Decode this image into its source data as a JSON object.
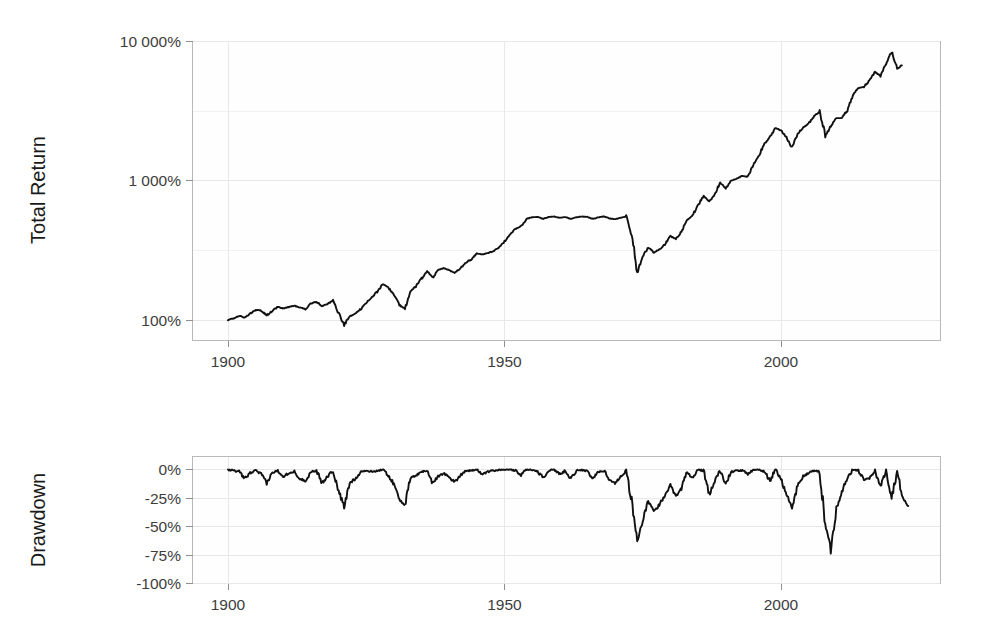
{
  "figure": {
    "background_color": "#ffffff",
    "line_color": "#111111",
    "grid_color": "#e8e8e8",
    "frame_color": "#b9b9b9"
  },
  "panels": {
    "top": {
      "ylabel": "Total Return",
      "y_ticks": [
        "10 000%",
        "1 000%",
        "100%"
      ],
      "x_ticks": [
        "1900",
        "1950",
        "2000"
      ]
    },
    "bottom": {
      "ylabel": "Drawdown",
      "y_ticks": [
        "0%",
        "-25%",
        "-50%",
        "-75%",
        "-100%"
      ],
      "x_ticks": [
        "1900",
        "1950",
        "2000"
      ]
    }
  },
  "chart_data": [
    {
      "type": "line",
      "title": "",
      "xlabel": "",
      "ylabel": "Total Return",
      "yscale": "log",
      "ylim": [
        70,
        13000
      ],
      "xlim": [
        1899,
        1924.5
      ],
      "grid": true,
      "legend": "none",
      "ytick_values": [
        100,
        1000,
        10000
      ],
      "ytick_labels": [
        "100%",
        "1 000%",
        "10 000%"
      ],
      "xtick_values": [
        1900,
        1950,
        2000
      ],
      "xtick_labels": [
        "1900",
        "1950",
        "2000"
      ],
      "series": [
        {
          "name": "Total Return",
          "x": [
            1900,
            1901,
            1902,
            1903,
            1904,
            1905,
            1906,
            1907,
            1908,
            1909,
            1910,
            1911,
            1912,
            1913,
            1914,
            1915,
            1916,
            1917,
            1918,
            1919,
            1920,
            1921,
            1922,
            1923,
            1924,
            1925,
            1926,
            1927,
            1928,
            1929,
            1930,
            1931,
            1932,
            1933,
            1934,
            1935,
            1936,
            1937,
            1938,
            1939,
            1940,
            1941,
            1942,
            1943,
            1944,
            1945,
            1946,
            1947,
            1948,
            1949,
            1950,
            1951,
            1952,
            1953,
            1954,
            1955,
            1956,
            1957,
            1958,
            1959,
            1960,
            1961,
            1962,
            1963,
            1964,
            1965,
            1966,
            1967,
            1968,
            1969,
            1970,
            1971,
            1972,
            1973,
            1974,
            1975,
            1976,
            1977,
            1978,
            1979,
            1980,
            1981,
            1982,
            1983,
            1984,
            1985,
            1986,
            1987,
            1988,
            1989,
            1990,
            1991,
            1992,
            1993,
            1994,
            1995,
            1996,
            1997,
            1998,
            1999,
            2000,
            2001,
            2002,
            2003,
            2004,
            2005,
            2006,
            2007,
            2008,
            2009,
            2010,
            2011,
            2012,
            2013,
            2014,
            2015,
            2016,
            2017,
            2018,
            2019,
            2020,
            2021,
            2022,
            2023
          ],
          "y": [
            100,
            103,
            107,
            104,
            111,
            118,
            117,
            108,
            116,
            124,
            121,
            124,
            127,
            123,
            120,
            131,
            135,
            126,
            130,
            138,
            112,
            92,
            106,
            110,
            120,
            133,
            145,
            160,
            180,
            172,
            150,
            128,
            120,
            160,
            175,
            198,
            225,
            200,
            228,
            235,
            228,
            218,
            232,
            258,
            272,
            300,
            295,
            302,
            312,
            330,
            365,
            410,
            450,
            470,
            530,
            545,
            548,
            530,
            548,
            552,
            540,
            548,
            530,
            545,
            552,
            548,
            530,
            545,
            552,
            535,
            528,
            540,
            552,
            400,
            215,
            285,
            330,
            305,
            320,
            350,
            400,
            380,
            430,
            520,
            560,
            660,
            780,
            700,
            790,
            960,
            880,
            1000,
            1030,
            1080,
            1060,
            1290,
            1500,
            1830,
            2050,
            2380,
            2280,
            2050,
            1700,
            2150,
            2400,
            2550,
            2900,
            3100,
            2050,
            2450,
            2800,
            2800,
            3200,
            4100,
            4600,
            4700,
            5200,
            6000,
            5600,
            6800,
            8400,
            6300,
            6800
          ],
          "notes": "S&P/US equities cumulative total return, indexed to 100% at 1900, log scale"
        }
      ]
    },
    {
      "type": "line",
      "title": "",
      "xlabel": "",
      "ylabel": "Drawdown",
      "yscale": "linear",
      "ylim": [
        -100,
        3
      ],
      "xlim": [
        1899,
        1924.5
      ],
      "grid": true,
      "legend": "none",
      "ytick_values": [
        0,
        -25,
        -50,
        -75,
        -100
      ],
      "ytick_labels": [
        "0%",
        "-25%",
        "-50%",
        "-75%",
        "-100%"
      ],
      "xtick_values": [
        1900,
        1950,
        2000
      ],
      "xtick_labels": [
        "1900",
        "1950",
        "2000"
      ],
      "series": [
        {
          "name": "Drawdown",
          "x": [
            1900,
            1901,
            1902,
            1903,
            1904,
            1905,
            1906,
            1907,
            1908,
            1909,
            1910,
            1911,
            1912,
            1913,
            1914,
            1915,
            1916,
            1917,
            1918,
            1919,
            1920,
            1921,
            1922,
            1923,
            1924,
            1925,
            1926,
            1927,
            1928,
            1929,
            1930,
            1931,
            1932,
            1933,
            1934,
            1935,
            1936,
            1937,
            1938,
            1939,
            1940,
            1941,
            1942,
            1943,
            1944,
            1945,
            1946,
            1947,
            1948,
            1949,
            1950,
            1951,
            1952,
            1953,
            1954,
            1955,
            1956,
            1957,
            1958,
            1959,
            1960,
            1961,
            1962,
            1963,
            1964,
            1965,
            1966,
            1967,
            1968,
            1969,
            1970,
            1971,
            1972,
            1973,
            1974,
            1975,
            1976,
            1977,
            1978,
            1979,
            1980,
            1981,
            1982,
            1983,
            1984,
            1985,
            1986,
            1987,
            1988,
            1989,
            1990,
            1991,
            1992,
            1993,
            1994,
            1995,
            1996,
            1997,
            1998,
            1999,
            2000,
            2001,
            2002,
            2003,
            2004,
            2005,
            2006,
            2007,
            2008,
            2009,
            2010,
            2011,
            2012,
            2013,
            2014,
            2015,
            2016,
            2017,
            2018,
            2019,
            2020,
            2021,
            2022,
            2023
          ],
          "y": [
            0,
            -1,
            -2,
            -8,
            -3,
            -1,
            -4,
            -12,
            -3,
            -1,
            -6,
            -3,
            -2,
            -8,
            -10,
            -2,
            -1,
            -12,
            -6,
            -1,
            -19,
            -33,
            -12,
            -8,
            -2,
            -1,
            -2,
            -1,
            0,
            -5,
            -13,
            -26,
            -31,
            -8,
            -5,
            -2,
            -1,
            -12,
            -6,
            -3,
            -7,
            -11,
            -5,
            -1,
            -1,
            0,
            -4,
            -2,
            -1,
            0,
            0,
            0,
            -1,
            -5,
            0,
            0,
            -2,
            -7,
            -1,
            0,
            -4,
            -1,
            -8,
            -1,
            0,
            -2,
            -8,
            -2,
            -1,
            -9,
            -12,
            -6,
            -1,
            -28,
            -62,
            -45,
            -28,
            -37,
            -31,
            -22,
            -14,
            -23,
            -16,
            -2,
            -8,
            0,
            -1,
            -22,
            -10,
            -1,
            -13,
            -2,
            -1,
            -1,
            -4,
            0,
            0,
            -2,
            -10,
            0,
            -8,
            -22,
            -34,
            -14,
            -6,
            -3,
            -1,
            -2,
            -48,
            -70,
            -34,
            -19,
            -8,
            0,
            -1,
            -9,
            -8,
            -1,
            -15,
            -1,
            -24,
            -2,
            -25,
            -32
          ],
          "notes": "Peak-to-trough drawdown of the total return series, percent"
        }
      ]
    }
  ]
}
